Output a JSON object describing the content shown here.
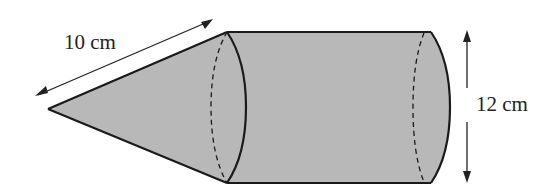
{
  "diagram": {
    "fill_color": "#b8b8b8",
    "stroke_color": "#1a1a1a",
    "labels": {
      "slant_height": "10 cm",
      "diameter": "12 cm"
    },
    "shapes": [
      {
        "type": "cone",
        "slant_height_label": "10 cm"
      },
      {
        "type": "cylinder",
        "diameter_label": "12 cm"
      }
    ]
  }
}
